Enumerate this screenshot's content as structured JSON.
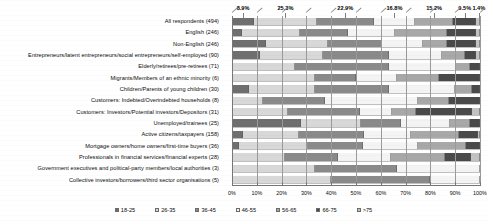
{
  "chart_data": {
    "type": "bar",
    "orientation": "horizontal",
    "stacked": true,
    "stack_mode": "percent",
    "title": "",
    "xlabel": "",
    "ylabel": "",
    "xlim": [
      0,
      100
    ],
    "xticks": [
      "0%",
      "10%",
      "20%",
      "30%",
      "40%",
      "50%",
      "60%",
      "70%",
      "80%",
      "90%",
      "100%"
    ],
    "grid": true,
    "legend_position": "bottom",
    "legend": [
      "18-25",
      "26-35",
      "36-45",
      "46-55",
      "56-65",
      "66-75",
      ">75"
    ],
    "series": [
      {
        "name": "18-25",
        "color": "#6f6f6f"
      },
      {
        "name": "26-35",
        "color": "#d8d8d8"
      },
      {
        "name": "36-45",
        "color": "#8a8a8a"
      },
      {
        "name": "46-55",
        "color": "#f4f4f4"
      },
      {
        "name": "56-65",
        "color": "#a8a8a8"
      },
      {
        "name": "66-75",
        "color": "#4a4a4a"
      },
      {
        "name": ">75",
        "color": "#c2c2c2"
      }
    ],
    "categories": [
      "All respondents (494)",
      "English (246)",
      "Non-English (246)",
      "Entrepreneurs/latent entrepreneurs/social entrepreneurs/self-employed (90)",
      "Elderly/retirees/pre-retirees (71)",
      "Migrants/Members of an ethnic minority (6)",
      "Children/Parents of young children (30)",
      "Customers: Indebted/Overindebted households (8)",
      "Customers: Investors/Potential investors/Depositors (31)",
      "Unemployed/trainees (25)",
      "Active citizens/taxpayers (158)",
      "Mortgage owners/home owners/first-time buyers (36)",
      "Professionals in financial services/financial experts (28)",
      "Government executives and political-party members/local authorities (3)",
      "Collective investors/borrowers/third sector organisations (5)"
    ],
    "values": [
      [
        8.9,
        25.3,
        22.9,
        16.8,
        15.2,
        9.5,
        1.4
      ],
      [
        4.1,
        23.2,
        19.5,
        19.1,
        20.7,
        11.8,
        1.6
      ],
      [
        13.8,
        24.8,
        22.0,
        16.3,
        9.8,
        11.8,
        1.5
      ],
      [
        11.1,
        25.6,
        26.7,
        21.1,
        9.4,
        4.4,
        1.7
      ],
      [
        0.0,
        25.4,
        38.0,
        26.8,
        5.6,
        4.2,
        0.0
      ],
      [
        0.0,
        33.3,
        16.7,
        16.7,
        16.7,
        16.7,
        0.0
      ],
      [
        6.7,
        26.7,
        30.0,
        26.6,
        6.7,
        3.3,
        0.0
      ],
      [
        0.0,
        12.5,
        25.0,
        37.5,
        12.5,
        12.5,
        0.0
      ],
      [
        0.0,
        22.6,
        29.0,
        12.9,
        9.7,
        22.6,
        3.2
      ],
      [
        28.0,
        24.0,
        16.0,
        20.0,
        8.0,
        4.0,
        0.0
      ],
      [
        4.4,
        22.8,
        25.9,
        19.0,
        19.6,
        7.6,
        0.7
      ],
      [
        2.8,
        27.7,
        22.2,
        22.3,
        19.4,
        5.6,
        0.0
      ],
      [
        0.0,
        21.4,
        21.5,
        21.4,
        21.4,
        10.7,
        3.6
      ],
      [
        0.0,
        33.3,
        33.3,
        33.4,
        0.0,
        0.0,
        0.0
      ],
      [
        0.0,
        40.0,
        40.0,
        20.0,
        0.0,
        0.0,
        0.0
      ]
    ],
    "data_labels_top_row": [
      {
        "text": "8.9%",
        "center": 4.45
      },
      {
        "text": "25.3%",
        "center": 21.55
      },
      {
        "text": "22.9%",
        "center": 45.65
      },
      {
        "text": "16.8%",
        "center": 65.5
      },
      {
        "text": "15.2%",
        "center": 81.5
      },
      {
        "text": "9.5%",
        "center": 93.85
      },
      {
        "text": "1.4%",
        "center": 99.5
      }
    ]
  }
}
